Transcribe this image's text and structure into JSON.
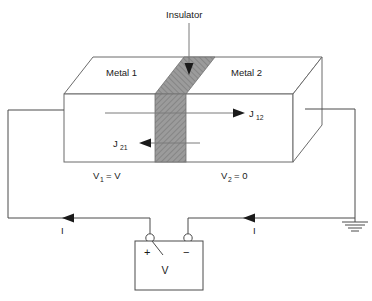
{
  "figure": {
    "title_label": "Insulator",
    "metal_left_label": "Metal 1",
    "metal_right_label": "Metal 2",
    "current_density_right": "J",
    "current_density_right_sub": "12",
    "current_density_left": "J",
    "current_density_left_sub": "21",
    "voltage_left": "V",
    "voltage_left_sub": "1",
    "voltage_left_eq": "= V",
    "voltage_right": "V",
    "voltage_right_sub": "2",
    "voltage_right_eq": "= 0",
    "current_left_label": "I",
    "current_right_label": "I",
    "battery_label": "V",
    "battery_plus": "+",
    "battery_minus": "−",
    "colors": {
      "insulator_fill": "#9a9a9a",
      "insulator_top_fill": "#8f8f8f",
      "line": "#6b6b6b",
      "wire": "#4a4a4a",
      "text": "#1a1a1a",
      "background": "#ffffff"
    }
  }
}
